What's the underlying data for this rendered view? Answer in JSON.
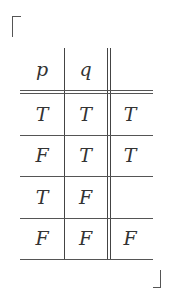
{
  "table": {
    "headers": [
      "p",
      "q",
      ""
    ],
    "rows": [
      [
        "T",
        "T",
        "T"
      ],
      [
        "F",
        "T",
        "T"
      ],
      [
        "T",
        "F",
        ""
      ],
      [
        "F",
        "F",
        "F"
      ]
    ]
  }
}
